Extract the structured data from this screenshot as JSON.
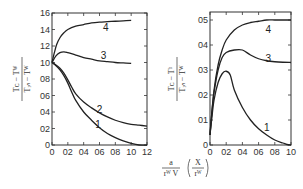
{
  "chart_data": [
    {
      "type": "line",
      "title": "",
      "xlabel": "(a / (r_w V)) (X / r_w)",
      "ylabel": "(T_c - T_w) / (T_in - T_w)",
      "xlim": [
        0,
        1.2
      ],
      "ylim": [
        0,
        1.6
      ],
      "xticks": [
        0,
        0.2,
        0.4,
        0.6,
        0.8,
        1.0,
        1.2
      ],
      "xtick_labels": [
        "0",
        "02",
        "04",
        "06",
        "08",
        "10",
        "12"
      ],
      "yticks": [
        0,
        0.2,
        0.4,
        0.6,
        0.8,
        1.0,
        1.2,
        1.4,
        1.6
      ],
      "ytick_labels": [
        "0",
        "02",
        "04",
        "06",
        "08",
        "10",
        "12",
        "14",
        "16"
      ],
      "grid": false,
      "series": [
        {
          "name": "4",
          "x": [
            0,
            0.03,
            0.06,
            0.1,
            0.15,
            0.2,
            0.3,
            0.4,
            0.5,
            0.6,
            0.7,
            0.8,
            0.9,
            1.0
          ],
          "values": [
            1.0,
            1.12,
            1.22,
            1.3,
            1.36,
            1.4,
            1.44,
            1.46,
            1.48,
            1.49,
            1.495,
            1.5,
            1.505,
            1.51
          ]
        },
        {
          "name": "3",
          "x": [
            0,
            0.05,
            0.1,
            0.15,
            0.2,
            0.3,
            0.4,
            0.5,
            0.6,
            0.7,
            0.8,
            0.9,
            1.0
          ],
          "values": [
            1.0,
            1.08,
            1.12,
            1.13,
            1.12,
            1.09,
            1.06,
            1.04,
            1.02,
            1.01,
            1.0,
            0.995,
            0.99
          ]
        },
        {
          "name": "2",
          "x": [
            0,
            0.05,
            0.1,
            0.15,
            0.2,
            0.25,
            0.3,
            0.4,
            0.5,
            0.6,
            0.7,
            0.8,
            0.9,
            1.0,
            1.1,
            1.2
          ],
          "values": [
            1.0,
            0.97,
            0.93,
            0.87,
            0.79,
            0.7,
            0.62,
            0.52,
            0.45,
            0.39,
            0.34,
            0.3,
            0.27,
            0.25,
            0.24,
            0.23
          ]
        },
        {
          "name": "1",
          "x": [
            0,
            0.05,
            0.1,
            0.15,
            0.2,
            0.25,
            0.3,
            0.4,
            0.5,
            0.6,
            0.7,
            0.8,
            0.9,
            1.0,
            1.1,
            1.2
          ],
          "values": [
            1.0,
            0.96,
            0.91,
            0.84,
            0.75,
            0.64,
            0.54,
            0.4,
            0.3,
            0.21,
            0.14,
            0.09,
            0.05,
            0.02,
            0.0,
            -0.01
          ]
        }
      ],
      "annotations": [
        {
          "text": "4",
          "x": 0.68,
          "y": 1.42
        },
        {
          "text": "3",
          "x": 0.65,
          "y": 1.08
        },
        {
          "text": "2",
          "x": 0.6,
          "y": 0.42
        },
        {
          "text": "1",
          "x": 0.58,
          "y": 0.24
        }
      ]
    },
    {
      "type": "line",
      "title": "",
      "xlabel": "(a / (r_w V)) (X / r_w)",
      "ylabel": "(T_c - T_b) / (T_in - T_w)",
      "xlim": [
        0,
        1.0
      ],
      "ylim": [
        0,
        0.53
      ],
      "xticks": [
        0,
        0.2,
        0.4,
        0.6,
        0.8,
        1.0
      ],
      "xtick_labels": [
        "0",
        "02",
        "04",
        "06",
        "08",
        "10"
      ],
      "yticks": [
        0,
        0.1,
        0.2,
        0.3,
        0.4,
        0.5
      ],
      "ytick_labels": [
        "0",
        "01",
        "02",
        "03",
        "04",
        "05"
      ],
      "grid": false,
      "series": [
        {
          "name": "4",
          "x": [
            0,
            0.02,
            0.05,
            0.1,
            0.15,
            0.2,
            0.3,
            0.4,
            0.5,
            0.6,
            0.7,
            0.8,
            0.9,
            1.0
          ],
          "values": [
            0.04,
            0.12,
            0.22,
            0.32,
            0.38,
            0.42,
            0.46,
            0.48,
            0.49,
            0.495,
            0.5,
            0.5,
            0.5,
            0.5
          ]
        },
        {
          "name": "3",
          "x": [
            0,
            0.02,
            0.05,
            0.1,
            0.15,
            0.2,
            0.3,
            0.4,
            0.5,
            0.6,
            0.7,
            0.8,
            0.9,
            1.0
          ],
          "values": [
            0.04,
            0.12,
            0.21,
            0.3,
            0.35,
            0.37,
            0.38,
            0.38,
            0.36,
            0.345,
            0.337,
            0.333,
            0.331,
            0.33
          ]
        },
        {
          "name": "1",
          "x": [
            0,
            0.02,
            0.05,
            0.1,
            0.15,
            0.2,
            0.25,
            0.3,
            0.4,
            0.5,
            0.6,
            0.7,
            0.8,
            0.9,
            0.95,
            1.0
          ],
          "values": [
            0.04,
            0.1,
            0.18,
            0.25,
            0.285,
            0.295,
            0.28,
            0.22,
            0.15,
            0.1,
            0.065,
            0.04,
            0.02,
            0.008,
            0.002,
            0.0
          ]
        }
      ],
      "annotations": [
        {
          "text": "4",
          "x": 0.72,
          "y": 0.46
        },
        {
          "text": "3",
          "x": 0.72,
          "y": 0.345
        },
        {
          "text": "1",
          "x": 0.7,
          "y": 0.07
        }
      ]
    }
  ],
  "labels": {
    "left_ylabel_num": "Tᴄ − Tᵂ",
    "left_ylabel_den": "Tᵢₙ − Tᵂ",
    "right_ylabel_num": "Tᴄ − Tᵇ",
    "right_ylabel_den": "Tᵢₙ − Tᵂ",
    "xlabel_frac_num": "a",
    "xlabel_frac_den": "rᵂ V",
    "xlabel_paren_num": "X",
    "xlabel_paren_den": "rᵂ"
  }
}
